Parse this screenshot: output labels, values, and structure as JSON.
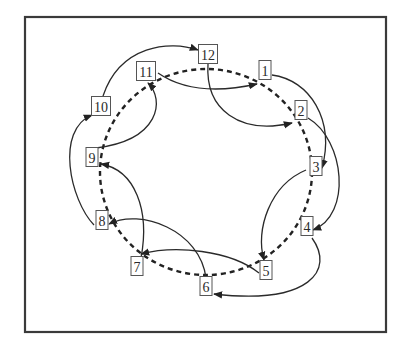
{
  "diagram": {
    "type": "ring-with-skip-links",
    "frame": {
      "x": 25,
      "y": 17,
      "width": 361,
      "height": 315
    },
    "ring": {
      "cx": 206,
      "cy": 172,
      "rx": 106,
      "ry": 103,
      "style": "dashed"
    },
    "nodes": [
      {
        "id": "1",
        "label": "1",
        "x": 265,
        "y": 70
      },
      {
        "id": "2",
        "label": "2",
        "x": 301,
        "y": 110
      },
      {
        "id": "3",
        "label": "3",
        "x": 316,
        "y": 166
      },
      {
        "id": "4",
        "label": "4",
        "x": 307,
        "y": 226
      },
      {
        "id": "5",
        "label": "5",
        "x": 266,
        "y": 270
      },
      {
        "id": "6",
        "label": "6",
        "x": 206,
        "y": 286
      },
      {
        "id": "7",
        "label": "7",
        "x": 137,
        "y": 266
      },
      {
        "id": "8",
        "label": "8",
        "x": 102,
        "y": 220
      },
      {
        "id": "9",
        "label": "9",
        "x": 92,
        "y": 157
      },
      {
        "id": "10",
        "label": "10",
        "x": 101,
        "y": 106
      },
      {
        "id": "11",
        "label": "11",
        "x": 146,
        "y": 71
      },
      {
        "id": "12",
        "label": "12",
        "x": 208,
        "y": 54
      }
    ],
    "edges": [
      {
        "from": "1",
        "to": "3"
      },
      {
        "from": "2",
        "to": "4"
      },
      {
        "from": "3",
        "to": "5"
      },
      {
        "from": "4",
        "to": "6"
      },
      {
        "from": "5",
        "to": "7"
      },
      {
        "from": "6",
        "to": "8"
      },
      {
        "from": "7",
        "to": "9"
      },
      {
        "from": "8",
        "to": "10"
      },
      {
        "from": "9",
        "to": "11"
      },
      {
        "from": "10",
        "to": "12"
      },
      {
        "from": "11",
        "to": "1"
      },
      {
        "from": "12",
        "to": "2"
      }
    ]
  }
}
